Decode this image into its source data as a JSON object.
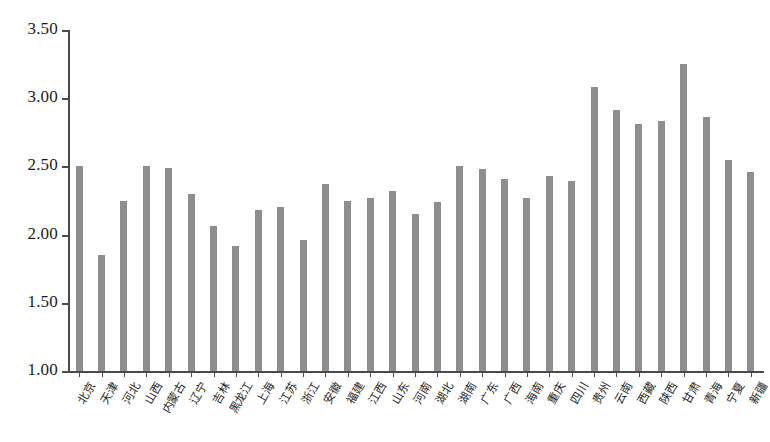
{
  "chart_data": {
    "type": "bar",
    "title": "",
    "subtitle": "",
    "xlabel": "",
    "ylabel": "",
    "ylim": [
      1.0,
      3.5
    ],
    "ytick_step": 0.5,
    "ytick_labels": [
      "3.50",
      "3.00",
      "2.50",
      "2.00",
      "1.50",
      "1.00"
    ],
    "ytick_values": [
      3.5,
      3.0,
      2.5,
      2.0,
      1.5,
      1.0
    ],
    "grid": false,
    "legend": null,
    "bar_color": "#8e8e8e",
    "axis_color": "#4a4a4a",
    "categories": [
      "北京",
      "天津",
      "河北",
      "山西",
      "内蒙古",
      "辽宁",
      "吉林",
      "黑龙江",
      "上海",
      "江苏",
      "浙江",
      "安徽",
      "福建",
      "江西",
      "山东",
      "河南",
      "湖北",
      "湖南",
      "广东",
      "广西",
      "海南",
      "重庆",
      "四川",
      "贵州",
      "云南",
      "西藏",
      "陕西",
      "甘肃",
      "青海",
      "宁夏",
      "新疆"
    ],
    "values": [
      2.5,
      1.85,
      2.25,
      2.5,
      2.49,
      2.3,
      2.06,
      1.92,
      2.18,
      2.2,
      1.96,
      2.37,
      2.25,
      2.27,
      2.32,
      2.15,
      2.24,
      2.5,
      2.48,
      2.41,
      2.27,
      2.43,
      2.39,
      3.08,
      2.91,
      2.81,
      2.83,
      3.25,
      2.86,
      2.55,
      2.46
    ]
  }
}
